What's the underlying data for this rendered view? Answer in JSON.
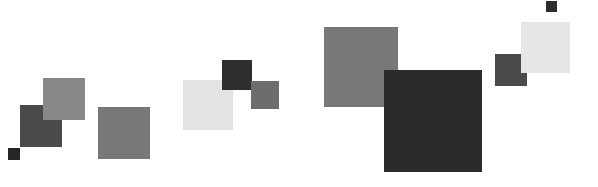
{
  "canvas": {
    "width": 598,
    "height": 187,
    "background": "#ffffff",
    "title": "Abstract Grayscale Squares Composition"
  },
  "palette": {
    "near_black": "#262626",
    "dark_gray": "#3f3f3f",
    "medium_dark_gray": "#4d4d4d",
    "medium_gray": "#6e6e6e",
    "gray": "#797979",
    "light_gray": "#e4e4e4",
    "very_light_gray": "#e8e8e8",
    "white": "#ffffff"
  },
  "shapes": [
    {
      "id": "square-1",
      "name": "small-dark-square-far-left",
      "group": "left-cluster",
      "x": 8,
      "y": 148,
      "width": 12,
      "height": 12,
      "color": "#262626"
    },
    {
      "id": "square-2",
      "name": "dark-square-left",
      "group": "left-cluster",
      "x": 20,
      "y": 105,
      "width": 42,
      "height": 42,
      "color": "#4a4a4a"
    },
    {
      "id": "square-3",
      "name": "gray-square-left-upper",
      "group": "left-cluster",
      "x": 43,
      "y": 78,
      "width": 42,
      "height": 42,
      "color": "#888888"
    },
    {
      "id": "square-4",
      "name": "gray-square-left-lower",
      "group": "left-cluster",
      "x": 98,
      "y": 107,
      "width": 52,
      "height": 52,
      "color": "#787878"
    },
    {
      "id": "square-5",
      "name": "light-square-middle",
      "group": "middle-cluster",
      "x": 183,
      "y": 80,
      "width": 50,
      "height": 50,
      "color": "#e3e3e3"
    },
    {
      "id": "square-6",
      "name": "dark-square-middle",
      "group": "middle-cluster",
      "x": 222,
      "y": 60,
      "width": 30,
      "height": 30,
      "color": "#2e2e2e"
    },
    {
      "id": "square-7",
      "name": "medium-gray-square-middle",
      "group": "middle-cluster",
      "x": 251,
      "y": 81,
      "width": 28,
      "height": 28,
      "color": "#6d6d6d"
    },
    {
      "id": "square-8",
      "name": "gray-square-right-upper",
      "group": "right-cluster",
      "x": 324,
      "y": 27,
      "width": 74,
      "height": 80,
      "color": "#787878"
    },
    {
      "id": "square-9",
      "name": "large-dark-square-right",
      "group": "right-cluster",
      "x": 384,
      "y": 70,
      "width": 98,
      "height": 102,
      "color": "#2b2b2b"
    },
    {
      "id": "square-10",
      "name": "medium-dark-square-far-right",
      "group": "right-cluster",
      "x": 495,
      "y": 54,
      "width": 32,
      "height": 32,
      "color": "#4a4a4a"
    },
    {
      "id": "square-11",
      "name": "light-square-far-right",
      "group": "right-cluster",
      "x": 521,
      "y": 22,
      "width": 49,
      "height": 51,
      "color": "#e6e6e6"
    },
    {
      "id": "square-12",
      "name": "small-dark-square-top-right",
      "group": "right-cluster",
      "x": 546,
      "y": 1,
      "width": 11,
      "height": 11,
      "color": "#2b2b2b"
    }
  ]
}
